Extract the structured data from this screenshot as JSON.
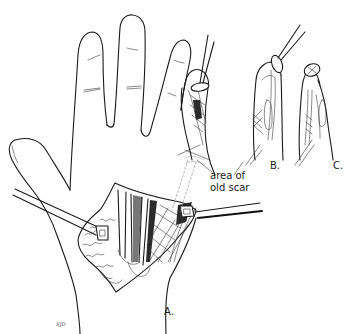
{
  "figure": {
    "type": "surgical-illustration",
    "panels": [
      {
        "id": "A",
        "label": "A.",
        "description": "Palm exposed via incision held open by two retractors, showing flexor tendons"
      },
      {
        "id": "B",
        "label": "B.",
        "description": "Finger with tendon pull-out suture and button at fingertip"
      },
      {
        "id": "C",
        "label": "C.",
        "description": "Finger with tendon repair, button at fingertip"
      }
    ],
    "annotations": [
      {
        "id": "scar",
        "text_line1": "area of",
        "text_line2": "old scar"
      }
    ],
    "signature": "SJD",
    "colors": {
      "ink": "#1a1a1a",
      "background": "#ffffff"
    }
  }
}
